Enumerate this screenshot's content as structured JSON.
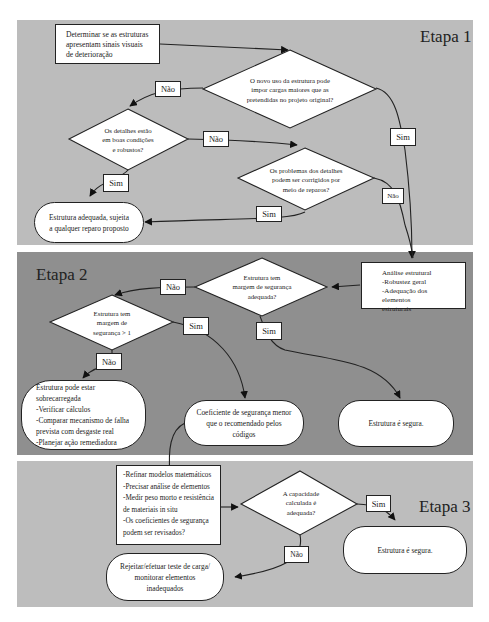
{
  "stages": [
    {
      "label": "Etapa 1"
    },
    {
      "label": "Etapa 2"
    },
    {
      "label": "Etapa 3"
    }
  ],
  "etapa1": {
    "start_box": [
      "Determinar se as estruturas",
      "apresentam sinais visuais",
      "de deterioração"
    ],
    "decision_new_use": [
      "O novo uso da estrutura pode",
      "impor cargas maiores que as",
      "pretendidas no projeto original?"
    ],
    "decision_details_ok": [
      "Os detalhes estão",
      "em boas condições",
      "e robustos?"
    ],
    "decision_details_repair": [
      "Os problemas dos detalhes",
      "podem ser corrigidos por",
      "meio de reparos?"
    ],
    "terminal_adequate": [
      "Estrutura adequada, sujeita",
      "a qualquer reparo proposto"
    ],
    "labels": {
      "new_use_no": "Não",
      "new_use_yes": "Sim",
      "details_ok_no": "Não",
      "details_ok_yes": "Sim",
      "repair_yes": "Sim",
      "repair_no": "Não"
    }
  },
  "etapa2": {
    "analysis_box": [
      "Análise estrutural",
      "-Robustez geral",
      "-Adequação dos elementos",
      "estruturais"
    ],
    "decision_margin": [
      "Estrutura tem",
      "margem de segurança",
      "adequada?"
    ],
    "decision_margin_gt1": [
      "Estrutura tem",
      "margem de",
      "segurança > 1"
    ],
    "terminal_overloaded": [
      "Estrutura pode estar sobrecarregada",
      "-Verificar cálculos",
      "-Comparar mecanismo de falha",
      "prevista com desgaste real",
      "-Planejar ação remediadora"
    ],
    "terminal_coefficient": [
      "Coeficiente de segurança menor",
      "que o recomendado pelos códigos"
    ],
    "terminal_safe": "Estrutura é segura.",
    "labels": {
      "margin_no": "Não",
      "margin_yes": "Sim",
      "gt1_yes": "Sim",
      "gt1_no": "Não"
    }
  },
  "etapa3": {
    "refine_box": [
      "-Refinar modelos matemáticos",
      "-Precisar análise de elementos",
      "-Medir peso morto e resistência",
      "de materiais in situ",
      "-Os coeficientes de segurança",
      "podem ser revisados?"
    ],
    "decision_capacity": [
      "A capacidade",
      "calculada é",
      "adequada?"
    ],
    "terminal_safe": "Estrutura é segura.",
    "terminal_reject": [
      "Rejeitar/efetuar teste de carga/",
      "monitorar elementos inadequados"
    ],
    "labels": {
      "capacity_yes": "Sim",
      "capacity_no": "Não"
    }
  },
  "colors": {
    "panel_light": "#bcbcbc",
    "panel_dark": "#8f8f8f",
    "shape_fill": "#ffffff",
    "stroke": "#222222"
  }
}
